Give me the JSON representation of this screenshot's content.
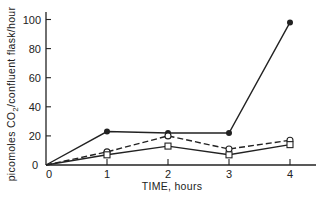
{
  "chart_data": {
    "type": "line",
    "title": "",
    "xlabel": "TIME, hours",
    "ylabel": "picomoles CO2/confluent flask/hour",
    "ylabel_main": "picomoles CO",
    "ylabel_sub": "2",
    "ylabel_tail": "/confluent flask/hour",
    "x": [
      0,
      1,
      2,
      3,
      4
    ],
    "xlim": [
      0,
      4.4
    ],
    "ylim": [
      0,
      105
    ],
    "x_ticks": [
      "0",
      "1",
      "2",
      "3",
      "4"
    ],
    "y_ticks": [
      "0",
      "20",
      "40",
      "60",
      "80",
      "100"
    ],
    "grid": false,
    "legend": "none",
    "series": [
      {
        "name": "filled circles (solid line)",
        "marker": "filled-circle",
        "line": "solid",
        "values": [
          0,
          23,
          22,
          22,
          98
        ]
      },
      {
        "name": "open circles (dashed line)",
        "marker": "open-circle",
        "line": "dashed",
        "values": [
          0,
          9,
          20,
          11,
          17
        ]
      },
      {
        "name": "open squares (solid line)",
        "marker": "open-square",
        "line": "solid",
        "values": [
          0,
          7,
          13,
          7,
          14
        ]
      }
    ]
  }
}
